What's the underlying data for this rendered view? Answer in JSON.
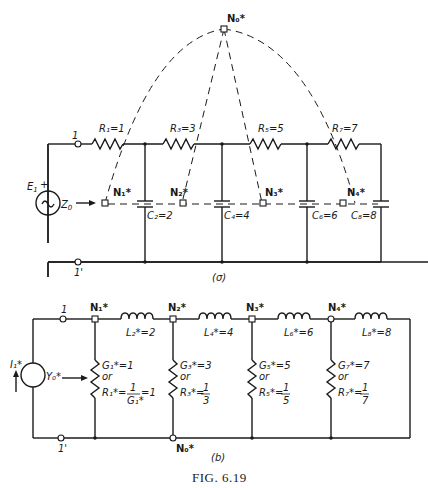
{
  "figure": {
    "caption": "Fig. 6.19",
    "caption_display": "FIG.  6.19"
  },
  "circuit_a": {
    "label": "(a)",
    "label_display": "(σ)",
    "source": {
      "name": "E1",
      "display": "E₁",
      "polarity": "+"
    },
    "impedance_label": "Z0",
    "impedance_display": "Z",
    "impedance_sub": "0",
    "terminals": {
      "top": "1",
      "bottom": "1'"
    },
    "series_resistors": [
      {
        "name": "R1",
        "value": 1,
        "label": "R₁=1"
      },
      {
        "name": "R3",
        "value": 3,
        "label": "R₃=3"
      },
      {
        "name": "R5",
        "value": 5,
        "label": "R₅=5"
      },
      {
        "name": "R7",
        "value": 7,
        "label": "R₇=7"
      }
    ],
    "shunt_capacitors": [
      {
        "name": "C2",
        "value": 2,
        "label": "C₂=2"
      },
      {
        "name": "C4",
        "value": 4,
        "label": "C₄=4"
      },
      {
        "name": "C6",
        "value": 6,
        "label": "C₆=6"
      },
      {
        "name": "C8",
        "value": 8,
        "label": "C₈=8"
      }
    ],
    "dual_nodes": [
      {
        "name": "N0*",
        "label": "N₀*"
      },
      {
        "name": "N1*",
        "label": "N₁*"
      },
      {
        "name": "N2*",
        "label": "N₂*"
      },
      {
        "name": "N3*",
        "label": "N₃*"
      },
      {
        "name": "N4*",
        "label": "N₄*"
      }
    ]
  },
  "circuit_b": {
    "label": "(b)",
    "label_display": "(b)",
    "source": {
      "name": "I1*",
      "display": "I₁*"
    },
    "admittance_label": "Y0*",
    "admittance_display": "Y₀*",
    "terminals": {
      "top": "1",
      "bottom": "1'"
    },
    "nodes": [
      {
        "name": "N1*",
        "label": "N₁*"
      },
      {
        "name": "N2*",
        "label": "N₂*"
      },
      {
        "name": "N3*",
        "label": "N₃*"
      },
      {
        "name": "N4*",
        "label": "N₄*"
      },
      {
        "name": "N0*",
        "label": "N₀*"
      }
    ],
    "series_inductors": [
      {
        "name": "L2*",
        "value": 2,
        "label": "L₂*=2"
      },
      {
        "name": "L4*",
        "value": 4,
        "label": "L₄*=4"
      },
      {
        "name": "L6*",
        "value": 6,
        "label": "L₆*=6"
      },
      {
        "name": "L8*",
        "value": 8,
        "label": "L₈*=8"
      }
    ],
    "shunt_conductances": [
      {
        "g_label": "G₁*=1",
        "or": "or",
        "r_label": "R₁*=",
        "r_value": "1/G₁* = 1",
        "num": "1",
        "den": "G₁*",
        "tail": "=1"
      },
      {
        "g_label": "G₃*=3",
        "or": "or",
        "r_label": "R₃*=",
        "r_value": "1/3",
        "num": "1",
        "den": "3",
        "tail": ""
      },
      {
        "g_label": "G₅*=5",
        "or": "or",
        "r_label": "R₅*=",
        "r_value": "1/5",
        "num": "1",
        "den": "5",
        "tail": ""
      },
      {
        "g_label": "G₇*=7",
        "or": "or",
        "r_label": "R₇*=",
        "r_value": "1/7",
        "num": "1",
        "den": "7",
        "tail": ""
      }
    ]
  }
}
